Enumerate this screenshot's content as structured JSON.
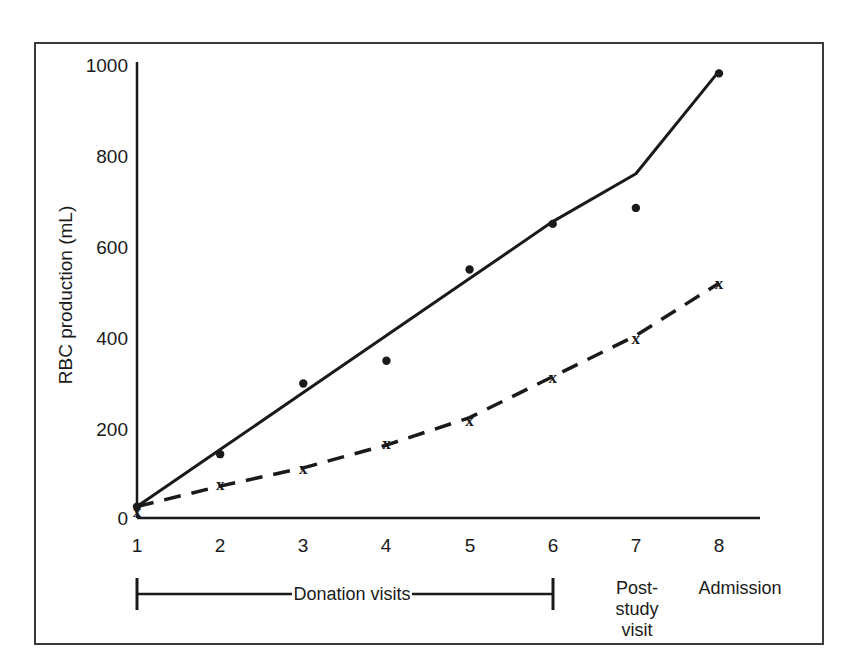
{
  "figure": {
    "frame_color": "#3a3a3a",
    "background": "#ffffff"
  },
  "chart_data": {
    "type": "line",
    "title": "",
    "xlabel": "",
    "ylabel": "RBC production (mL)",
    "x": [
      1,
      2,
      3,
      4,
      5,
      6,
      7,
      8
    ],
    "xtick_labels": [
      "1",
      "2",
      "3",
      "4",
      "5",
      "6",
      "7",
      "8"
    ],
    "ytick_labels": [
      "0",
      "200",
      "400",
      "600",
      "800",
      "1000"
    ],
    "yticks": [
      0,
      200,
      400,
      600,
      800,
      1000
    ],
    "ylim": [
      0,
      1000
    ],
    "xlim": [
      1,
      8
    ],
    "grid": false,
    "legend": "none",
    "series": [
      {
        "name": "solid-series",
        "marker": "circle",
        "linestyle": "solid",
        "color": "#1a1a1a",
        "values": [
          25,
          140,
          295,
          345,
          545,
          645,
          680,
          975
        ],
        "fit_values": [
          25,
          150,
          275,
          400,
          525,
          650,
          755,
          980
        ]
      },
      {
        "name": "dashed-series",
        "marker": "x",
        "linestyle": "dashed",
        "color": "#1a1a1a",
        "values": [
          15,
          75,
          110,
          165,
          215,
          310,
          395,
          515
        ],
        "fit_values": [
          25,
          70,
          110,
          160,
          220,
          310,
          400,
          515
        ]
      }
    ],
    "annotations": [
      {
        "name": "donation-visits",
        "label": "Donation visits",
        "span_start_x": 1,
        "span_end_x": 6
      },
      {
        "name": "post-study-visit",
        "label_line_1": "Post-",
        "label_line_2": "study",
        "label_line_3": "visit",
        "at_x": 7
      },
      {
        "name": "admission",
        "label": "Admission",
        "at_x": 8
      }
    ]
  }
}
